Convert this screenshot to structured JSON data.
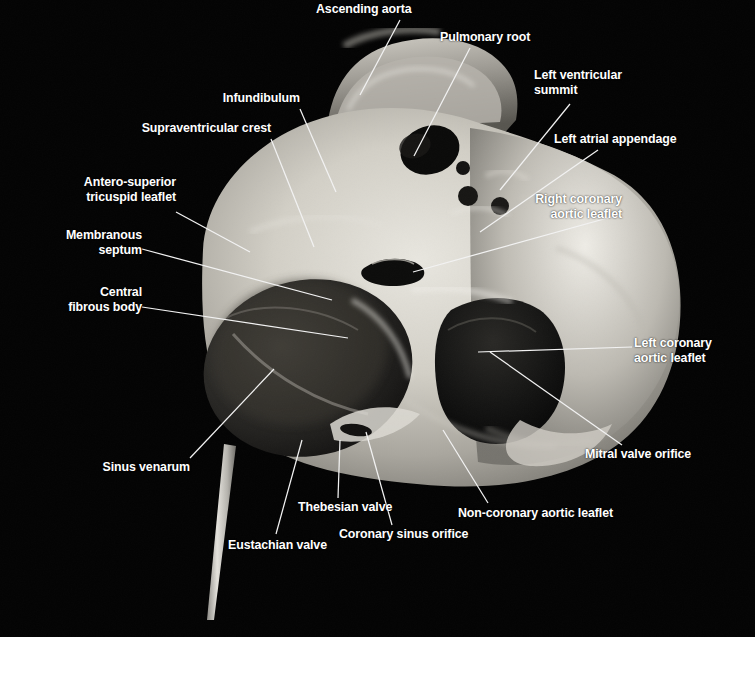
{
  "figure": {
    "kind": "anatomical-photograph",
    "background_color": "#030303",
    "label_color": "#ffffff",
    "leader_line_color": "#f2f2f2",
    "footer_color": "#ffffff"
  },
  "labels": [
    {
      "id": "ascending-aorta",
      "text": "Ascending aorta",
      "lines": [
        "Ascending aorta"
      ],
      "align": "left",
      "x": 316,
      "y": 2,
      "leader": {
        "x1": 400,
        "y1": 20,
        "x2": 360,
        "y2": 95
      }
    },
    {
      "id": "pulmonary-root",
      "text": "Pulmonary root",
      "lines": [
        "Pulmonary root"
      ],
      "align": "left",
      "x": 440,
      "y": 30,
      "leader": {
        "x1": 470,
        "y1": 48,
        "x2": 414,
        "y2": 156
      }
    },
    {
      "id": "infundibulum",
      "text": "Infundibulum",
      "lines": [
        "Infundibulum"
      ],
      "align": "right",
      "x": 224,
      "y": 91,
      "leader": {
        "x1": 300,
        "y1": 109,
        "x2": 336,
        "y2": 192
      }
    },
    {
      "id": "supraventricular-crest",
      "text": "Supraventricular crest",
      "lines": [
        "Supraventricular crest"
      ],
      "align": "right",
      "x": 129,
      "y": 121,
      "leader": {
        "x1": 271,
        "y1": 139,
        "x2": 314,
        "y2": 247
      }
    },
    {
      "id": "antero-superior-tricuspid-leaflet",
      "text": "Antero-superior tricuspid leaflet",
      "lines": [
        "Antero-superior",
        "tricuspid leaflet"
      ],
      "align": "right",
      "x": 57,
      "y": 175,
      "leader": {
        "x1": 176,
        "y1": 212,
        "x2": 250,
        "y2": 252
      }
    },
    {
      "id": "membranous-septum",
      "text": "Membranous septum",
      "lines": [
        "Membranous",
        "septum"
      ],
      "align": "right",
      "x": 57,
      "y": 228,
      "leader": {
        "x1": 142,
        "y1": 249,
        "x2": 332,
        "y2": 300
      }
    },
    {
      "id": "central-fibrous-body",
      "text": "Central fibrous body",
      "lines": [
        "Central",
        "fibrous body"
      ],
      "align": "right",
      "x": 57,
      "y": 285,
      "leader": {
        "x1": 142,
        "y1": 307,
        "x2": 348,
        "y2": 338
      }
    },
    {
      "id": "left-ventricular-summit",
      "text": "Left ventricular summit",
      "lines": [
        "Left ventricular",
        "summit"
      ],
      "align": "left",
      "x": 534,
      "y": 68,
      "leader": {
        "x1": 570,
        "y1": 104,
        "x2": 500,
        "y2": 190
      }
    },
    {
      "id": "left-atrial-appendage",
      "text": "Left atrial appendage",
      "lines": [
        "Left atrial appendage"
      ],
      "align": "left",
      "x": 554,
      "y": 132,
      "leader": {
        "x1": 598,
        "y1": 150,
        "x2": 480,
        "y2": 232
      }
    },
    {
      "id": "right-coronary-aortic-leaflet",
      "text": "Right coronary aortic leaflet",
      "lines": [
        "Right coronary",
        "aortic leaflet"
      ],
      "align": "right",
      "x": 534,
      "y": 192,
      "leader": {
        "x1": 622,
        "y1": 214,
        "x2": 413,
        "y2": 272
      }
    },
    {
      "id": "left-coronary-aortic-leaflet",
      "text": "Left coronary aortic leaflet",
      "lines": [
        "Left coronary",
        "aortic leaflet"
      ],
      "align": "left",
      "x": 634,
      "y": 336,
      "leader": {
        "x1": 632,
        "y1": 347,
        "x2": 478,
        "y2": 352
      }
    },
    {
      "id": "mitral-valve-orifice",
      "text": "Mitral valve orifice",
      "lines": [
        "Mitral valve orifice"
      ],
      "align": "left",
      "x": 585,
      "y": 447,
      "leader": {
        "x1": 622,
        "y1": 445,
        "x2": 490,
        "y2": 352
      }
    },
    {
      "id": "sinus-venarum",
      "text": "Sinus venarum",
      "lines": [
        "Sinus venarum"
      ],
      "align": "right",
      "x": 145,
      "y": 460,
      "leader": {
        "x1": 190,
        "y1": 458,
        "x2": 274,
        "y2": 369
      }
    },
    {
      "id": "thebesian-valve",
      "text": "Thebesian valve",
      "lines": [
        "Thebesian valve"
      ],
      "align": "left",
      "x": 298,
      "y": 500,
      "leader": {
        "x1": 338,
        "y1": 498,
        "x2": 340,
        "y2": 440
      }
    },
    {
      "id": "eustachian-valve",
      "text": "Eustachian valve",
      "lines": [
        "Eustachian valve"
      ],
      "align": "left",
      "x": 228,
      "y": 538,
      "leader": {
        "x1": 276,
        "y1": 534,
        "x2": 302,
        "y2": 440
      }
    },
    {
      "id": "coronary-sinus-orifice",
      "text": "Coronary sinus orifice",
      "lines": [
        "Coronary sinus orifice"
      ],
      "align": "left",
      "x": 339,
      "y": 527,
      "leader": {
        "x1": 392,
        "y1": 525,
        "x2": 366,
        "y2": 432
      }
    },
    {
      "id": "non-coronary-aortic-leaflet",
      "text": "Non-coronary aortic leaflet",
      "lines": [
        "Non-coronary aortic leaflet"
      ],
      "align": "left",
      "x": 458,
      "y": 506,
      "leader": {
        "x1": 488,
        "y1": 503,
        "x2": 443,
        "y2": 430
      }
    }
  ]
}
